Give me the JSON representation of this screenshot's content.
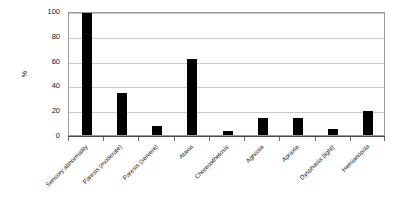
{
  "chart_data": {
    "type": "bar",
    "title": "",
    "subtitle": "",
    "xlabel": "",
    "ylabel": "%",
    "ylim": [
      0,
      100
    ],
    "yticks": [
      0,
      20,
      40,
      60,
      80,
      100
    ],
    "ytick_labels": [
      "0",
      "20",
      "40",
      "60",
      "80",
      "100"
    ],
    "grid": "horizontal",
    "legend": "none",
    "bar_color": "#000000",
    "plot_border_color": "#9a9a9a",
    "gridline_color": "#c9c9c9",
    "categories": [
      "Sensory abnormality",
      "Paresis (moderate)",
      "Paresis (servere)",
      "Ataxia",
      "Choreoathetosis",
      "Agnosia",
      "Apraxia",
      "Dysphasia (light)",
      "Hemianopsia"
    ],
    "values": [
      98,
      34,
      7,
      61,
      3,
      14,
      14,
      5,
      19
    ],
    "series": [
      {
        "name": "",
        "values": [
          98,
          34,
          7,
          61,
          3,
          14,
          14,
          5,
          19
        ]
      }
    ]
  }
}
